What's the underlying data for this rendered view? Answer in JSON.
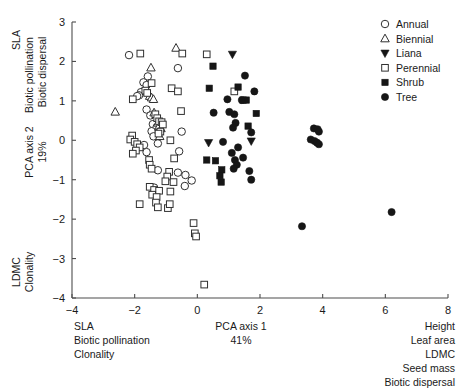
{
  "chart_data": {
    "type": "scatter",
    "title": "",
    "xlabel": "PCA axis 1",
    "xlabel_sub": "41%",
    "ylabel": "PCA axis 2",
    "ylabel_sub": "19%",
    "xlim": [
      -4,
      8
    ],
    "ylim": [
      -4,
      3
    ],
    "xticks": [
      -4,
      -2,
      0,
      2,
      4,
      6,
      8
    ],
    "xtick_labels": [
      "-4",
      "-2",
      "0",
      "2",
      "4",
      "6",
      "8"
    ],
    "yticks": [
      -4,
      -3,
      -2,
      -1,
      0,
      1,
      2,
      3
    ],
    "ytick_labels": [
      "-4",
      "-3",
      "-2",
      "-1",
      "0",
      "1",
      "2",
      "3"
    ],
    "grid": false,
    "legend_position": "top-right",
    "legend": [
      {
        "label": "Annual",
        "marker": "open-circle"
      },
      {
        "label": "Biennial",
        "marker": "open-triangle-up"
      },
      {
        "label": "Liana",
        "marker": "filled-triangle-down"
      },
      {
        "label": "Perennial",
        "marker": "open-square"
      },
      {
        "label": "Shrub",
        "marker": "filled-square"
      },
      {
        "label": "Tree",
        "marker": "filled-circle"
      }
    ],
    "annotations": {
      "y_axis_top": [
        "SLA",
        "Biotic pollination",
        "Biotic dispersal"
      ],
      "y_axis_bottom": [
        "LDMC",
        "Clonality"
      ],
      "x_axis_left": [
        "SLA",
        "Biotic pollination",
        "Clonality"
      ],
      "x_axis_right": [
        "Height",
        "Leaf area",
        "LDMC",
        "Seed mass",
        "Biotic dispersal"
      ]
    },
    "series": [
      {
        "name": "Annual",
        "marker": "open-circle",
        "points": [
          [
            -2.18,
            2.16
          ],
          [
            -1.58,
            1.62
          ],
          [
            -1.72,
            1.47
          ],
          [
            -1.62,
            1.4
          ],
          [
            -1.8,
            1.22
          ],
          [
            -1.86,
            1.14
          ],
          [
            -1.92,
            1.12
          ],
          [
            -0.62,
            1.83
          ],
          [
            -1.62,
            0.78
          ],
          [
            -1.5,
            0.63
          ],
          [
            -1.42,
            0.41
          ],
          [
            -1.3,
            0.33
          ],
          [
            -1.46,
            0.23
          ],
          [
            -1.4,
            0.1
          ],
          [
            -1.26,
            -0.08
          ],
          [
            -1.7,
            -0.12
          ],
          [
            -1.62,
            -0.3
          ],
          [
            -0.5,
            0.22
          ],
          [
            -0.58,
            -0.28
          ],
          [
            -0.62,
            -0.82
          ],
          [
            -0.38,
            -0.88
          ],
          [
            -0.18,
            -1.02
          ],
          [
            -0.4,
            -1.16
          ],
          [
            -1.38,
            -1.2
          ],
          [
            -1.26,
            -0.76
          ]
        ]
      },
      {
        "name": "Biennial",
        "marker": "open-triangle-up",
        "points": [
          [
            -0.68,
            2.34
          ],
          [
            -1.48,
            1.84
          ],
          [
            -1.52,
            1.12
          ],
          [
            -1.46,
            1.08
          ],
          [
            -1.4,
            1.04
          ],
          [
            -2.62,
            0.72
          ],
          [
            -1.38,
            0.7
          ],
          [
            -1.26,
            0.44
          ],
          [
            -1.22,
            0.36
          ],
          [
            -1.16,
            0.3
          ],
          [
            -1.2,
            0.1
          ]
        ]
      },
      {
        "name": "Liana",
        "marker": "filled-triangle-down",
        "points": [
          [
            1.12,
            2.18
          ],
          [
            0.36,
            -0.06
          ],
          [
            1.72,
            -0.02
          ]
        ]
      },
      {
        "name": "Perennial",
        "marker": "open-square",
        "points": [
          [
            -1.82,
            2.2
          ],
          [
            -0.48,
            2.2
          ],
          [
            -1.46,
            1.45
          ],
          [
            -1.66,
            1.26
          ],
          [
            -1.6,
            1.2
          ],
          [
            -2.06,
            1.04
          ],
          [
            -0.82,
            1.32
          ],
          [
            -0.62,
            1.24
          ],
          [
            -0.52,
            0.74
          ],
          [
            -1.34,
            0.66
          ],
          [
            -1.28,
            0.56
          ],
          [
            -1.22,
            0.48
          ],
          [
            -1.14,
            0.46
          ],
          [
            -1.1,
            0.4
          ],
          [
            -1.18,
            0.22
          ],
          [
            -1.24,
            0.17
          ],
          [
            -2.08,
            0.12
          ],
          [
            -2.14,
            0.02
          ],
          [
            -2.0,
            -0.04
          ],
          [
            -1.92,
            -0.1
          ],
          [
            -1.84,
            -0.18
          ],
          [
            -1.96,
            -0.26
          ],
          [
            -2.06,
            -0.34
          ],
          [
            -0.86,
            0.0
          ],
          [
            -0.74,
            -0.46
          ],
          [
            -1.54,
            -0.5
          ],
          [
            -1.52,
            -0.62
          ],
          [
            -1.46,
            -0.72
          ],
          [
            -0.9,
            -0.8
          ],
          [
            -0.96,
            -0.92
          ],
          [
            -1.02,
            -1.04
          ],
          [
            -0.76,
            -1.06
          ],
          [
            -1.52,
            -1.18
          ],
          [
            -1.38,
            -1.26
          ],
          [
            -1.22,
            -1.28
          ],
          [
            -0.86,
            -1.3
          ],
          [
            -1.44,
            -1.38
          ],
          [
            -1.3,
            -1.44
          ],
          [
            -1.84,
            -1.62
          ],
          [
            -1.32,
            -1.58
          ],
          [
            -1.26,
            -1.7
          ],
          [
            -0.94,
            -1.72
          ],
          [
            -0.88,
            -1.62
          ],
          [
            -0.12,
            -2.1
          ],
          [
            -0.08,
            -2.36
          ],
          [
            -0.04,
            -2.44
          ],
          [
            0.22,
            -3.66
          ],
          [
            0.3,
            2.18
          ],
          [
            1.18,
            1.24
          ]
        ]
      },
      {
        "name": "Shrub",
        "marker": "filled-square",
        "points": [
          [
            0.5,
            1.88
          ],
          [
            0.38,
            1.32
          ],
          [
            1.3,
            1.35
          ],
          [
            1.46,
            1.02
          ],
          [
            1.56,
            1.02
          ],
          [
            1.88,
            0.68
          ],
          [
            1.62,
            0.36
          ],
          [
            0.3,
            -0.5
          ],
          [
            0.58,
            -0.52
          ],
          [
            0.78,
            -0.75
          ],
          [
            0.72,
            -0.9
          ],
          [
            0.76,
            -1.06
          ]
        ]
      },
      {
        "name": "Tree",
        "marker": "filled-circle",
        "points": [
          [
            1.52,
            1.64
          ],
          [
            1.82,
            1.24
          ],
          [
            1.42,
            1.02
          ],
          [
            0.96,
            1.04
          ],
          [
            0.52,
            0.7
          ],
          [
            1.02,
            0.72
          ],
          [
            1.18,
            0.66
          ],
          [
            1.22,
            0.44
          ],
          [
            1.14,
            0.32
          ],
          [
            1.72,
            0.2
          ],
          [
            0.82,
            -0.04
          ],
          [
            1.3,
            -0.18
          ],
          [
            1.1,
            -0.32
          ],
          [
            1.46,
            -0.44
          ],
          [
            1.2,
            -0.5
          ],
          [
            1.26,
            -0.62
          ],
          [
            1.16,
            -0.72
          ],
          [
            1.66,
            -0.78
          ],
          [
            1.72,
            -1.0
          ],
          [
            3.72,
            0.3
          ],
          [
            3.84,
            0.28
          ],
          [
            3.88,
            0.22
          ],
          [
            3.62,
            0.02
          ],
          [
            3.74,
            -0.02
          ],
          [
            3.82,
            -0.06
          ],
          [
            3.88,
            -0.1
          ],
          [
            3.34,
            -2.18
          ],
          [
            6.2,
            -1.82
          ]
        ]
      }
    ]
  }
}
